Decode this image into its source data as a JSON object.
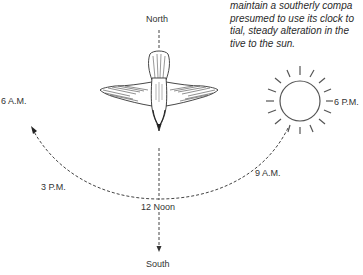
{
  "caption": {
    "lines": [
      "maintain a southerly compa",
      "presumed to use its clock to",
      "tial, steady alteration in the",
      "tive to the sun."
    ]
  },
  "labels": {
    "north": "North",
    "south": "South",
    "noon": "12 Noon",
    "six_am": "6 A.M.",
    "three_pm": "3 P.M.",
    "nine_am": "9 A.M.",
    "six_pm": "6 P.M."
  },
  "icons": {
    "bird": "bird-in-flight-icon",
    "sun": "sun-icon"
  },
  "colors": {
    "line": "#333333",
    "background": "#ffffff"
  }
}
